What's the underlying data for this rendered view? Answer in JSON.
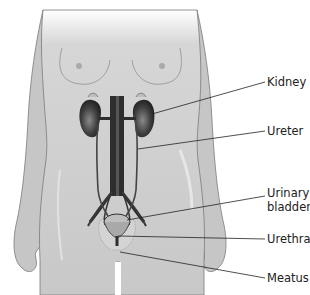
{
  "figure": {
    "colors": {
      "skin": "#c9c9c9",
      "skin_shadow": "#b5b5b5",
      "outline": "#6e6e6e",
      "organ_dark": "#3a3a3a",
      "vessels": "#2b2b2b",
      "label_text": "#222222",
      "leader_line": "#222222"
    }
  },
  "labels": [
    {
      "id": "kidney",
      "lines": [
        "Kidney"
      ]
    },
    {
      "id": "ureter",
      "lines": [
        "Ureter"
      ]
    },
    {
      "id": "bladder",
      "lines": [
        "Urinary",
        "bladder"
      ]
    },
    {
      "id": "urethra",
      "lines": [
        "Urethra"
      ]
    },
    {
      "id": "meatus",
      "lines": [
        "Meatus"
      ]
    }
  ]
}
